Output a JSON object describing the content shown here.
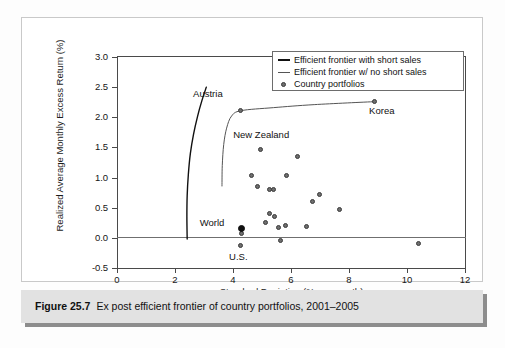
{
  "figure": {
    "number_label": "Figure 25.7",
    "caption": "Ex post efficient frontier of country portfolios, 2001–2005"
  },
  "chart_data": {
    "type": "scatter",
    "title": "",
    "xlabel": "Standard Deviation (% per month)",
    "ylabel": "Realized Average Monthly Excess Return (%)",
    "xlim": [
      0,
      12
    ],
    "ylim": [
      -0.5,
      3.0
    ],
    "xticks": [
      0,
      2,
      4,
      6,
      8,
      10,
      12
    ],
    "xtick_labels": [
      "0",
      "2",
      "4",
      "6",
      "8",
      "10",
      "12"
    ],
    "yticks": [
      -0.5,
      0.0,
      0.5,
      1.0,
      1.5,
      2.0,
      2.5,
      3.0
    ],
    "ytick_labels": [
      "-0.5",
      "0.0",
      "0.5",
      "1.0",
      "1.5",
      "2.0",
      "2.5",
      "3.0"
    ],
    "grid": false,
    "zero_line": true,
    "legend_position": "top-right",
    "legend": [
      {
        "key": "frontier_short_sales",
        "label": "Efficient frontier with short sales",
        "marker": "line-thick"
      },
      {
        "key": "frontier_no_short_sales",
        "label": "Efficient frontier w/ no short sales",
        "marker": "line-thin"
      },
      {
        "key": "country_portfolios",
        "label": "Country portfolios",
        "marker": "dot"
      }
    ],
    "series": [
      {
        "name": "Country portfolios",
        "type": "scatter",
        "marker_color": "#6e6e6e",
        "points": [
          {
            "x": 8.9,
            "y": 2.26,
            "label": "Korea"
          },
          {
            "x": 4.28,
            "y": 2.11,
            "label": "Austria"
          },
          {
            "x": 4.95,
            "y": 1.46,
            "label": ""
          },
          {
            "x": 6.25,
            "y": 1.35,
            "label": ""
          },
          {
            "x": 4.65,
            "y": 1.02,
            "label": ""
          },
          {
            "x": 5.85,
            "y": 1.02,
            "label": ""
          },
          {
            "x": 4.85,
            "y": 0.84,
            "label": ""
          },
          {
            "x": 5.28,
            "y": 0.79,
            "label": ""
          },
          {
            "x": 5.42,
            "y": 0.79,
            "label": ""
          },
          {
            "x": 7.0,
            "y": 0.71,
            "label": ""
          },
          {
            "x": 6.75,
            "y": 0.59,
            "label": ""
          },
          {
            "x": 7.68,
            "y": 0.47,
            "label": ""
          },
          {
            "x": 5.28,
            "y": 0.4,
            "label": ""
          },
          {
            "x": 5.45,
            "y": 0.34,
            "label": ""
          },
          {
            "x": 5.15,
            "y": 0.25,
            "label": ""
          },
          {
            "x": 5.58,
            "y": 0.17,
            "label": ""
          },
          {
            "x": 5.82,
            "y": 0.2,
            "label": ""
          },
          {
            "x": 6.55,
            "y": 0.18,
            "label": ""
          },
          {
            "x": 4.3,
            "y": 0.07,
            "label": ""
          },
          {
            "x": 5.66,
            "y": -0.05,
            "label": ""
          },
          {
            "x": 4.28,
            "y": -0.13,
            "label": "U.S."
          },
          {
            "x": 10.4,
            "y": -0.1,
            "label": ""
          }
        ]
      },
      {
        "name": "World",
        "type": "scatter",
        "marker_color": "#101010",
        "points": [
          {
            "x": 4.3,
            "y": 0.155,
            "label": "World"
          }
        ]
      },
      {
        "name": "Efficient frontier with short sales",
        "type": "line",
        "line_color": "#111111",
        "points": [
          {
            "x": 2.42,
            "y": -0.02
          },
          {
            "x": 2.41,
            "y": 0.35
          },
          {
            "x": 2.42,
            "y": 0.7
          },
          {
            "x": 2.46,
            "y": 1.05
          },
          {
            "x": 2.53,
            "y": 1.4
          },
          {
            "x": 2.64,
            "y": 1.72
          },
          {
            "x": 2.78,
            "y": 2.02
          },
          {
            "x": 2.93,
            "y": 2.28
          },
          {
            "x": 3.08,
            "y": 2.5
          }
        ]
      },
      {
        "name": "Efficient frontier w/ no short sales",
        "type": "line",
        "line_color": "#555555",
        "points": [
          {
            "x": 3.62,
            "y": 0.86
          },
          {
            "x": 3.63,
            "y": 1.2
          },
          {
            "x": 3.68,
            "y": 1.55
          },
          {
            "x": 3.78,
            "y": 1.82
          },
          {
            "x": 3.95,
            "y": 2.02
          },
          {
            "x": 4.28,
            "y": 2.11
          },
          {
            "x": 5.4,
            "y": 2.16
          },
          {
            "x": 6.8,
            "y": 2.21
          },
          {
            "x": 8.9,
            "y": 2.26
          }
        ]
      }
    ],
    "annotations": [
      {
        "text": "Austria",
        "x": 4.28,
        "y": 2.11,
        "dx": -48,
        "dy": -16
      },
      {
        "text": "Korea",
        "x": 8.9,
        "y": 2.26,
        "dx": -6,
        "dy": 10
      },
      {
        "text": "New Zealand",
        "x": 3.8,
        "y": 1.62,
        "dx": 6,
        "dy": -4
      },
      {
        "text": "World",
        "x": 4.3,
        "y": 0.155,
        "dx": -42,
        "dy": -5
      },
      {
        "text": "U.S.",
        "x": 4.28,
        "y": -0.13,
        "dx": -12,
        "dy": 12
      }
    ]
  }
}
